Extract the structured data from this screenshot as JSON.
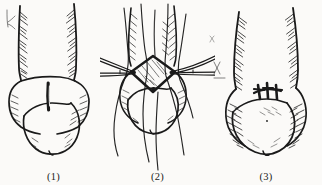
{
  "figure": {
    "medium": "pen-and-ink line drawing",
    "background_color": "#fbfaf8",
    "ink_color": "#1a1a1a",
    "width_px": 322,
    "height_px": 185,
    "panel_count": 3
  },
  "panels": [
    {
      "caption": "(1)",
      "name": "panel-incision-marking",
      "description": "Pre-operative view: shaft with hatched shading along both margins, rounded glans below, and a dark vertical slit marking the planned incision at the coronal junction.",
      "features": [
        "vertical-slit-incision-mark",
        "shaft-hatching-left",
        "shaft-hatching-right",
        "glans-outline",
        "coronal-sulcus-line"
      ]
    },
    {
      "caption": "(2)",
      "name": "panel-open-defect-with-forceps",
      "description": "Intra-operative view: diamond-shaped open defect held apart by two pairs of forceps entering from left and right; multiple suture threads curve down across the glans.",
      "features": [
        "diamond-shaped-defect",
        "defect-interior-hatching",
        "forceps-left",
        "forceps-right",
        "suture-threads",
        "glans-outline"
      ]
    },
    {
      "caption": "(3)",
      "name": "panel-closed-sutured",
      "description": "Post-operative view: defect closed with a horizontal row of three interrupted sutures; heavy hatching outlines the glans rim and shaft margins.",
      "features": [
        "transverse-closure-line",
        "suture-stitch-1",
        "suture-stitch-2",
        "suture-stitch-3",
        "glans-rim-hatching",
        "shaft-hatching"
      ]
    }
  ],
  "stitch_count": 3
}
